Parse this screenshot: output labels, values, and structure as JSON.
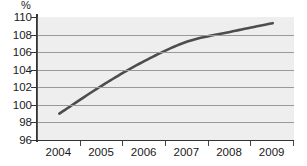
{
  "chart_data": {
    "type": "line",
    "title": "",
    "subtitle": "",
    "xlabel": "",
    "ylabel": "%",
    "unit_label": "%",
    "categories": [
      "2004",
      "2005",
      "2006",
      "2007",
      "2008",
      "2009"
    ],
    "x": [
      2004,
      2005,
      2006,
      2007,
      2008,
      2009
    ],
    "values": [
      99.0,
      102.2,
      105.0,
      107.2,
      108.3,
      109.3
    ],
    "series": [
      {
        "name": "",
        "values": [
          99.0,
          102.2,
          105.0,
          107.2,
          108.3,
          109.3
        ]
      }
    ],
    "ylim": [
      96,
      110
    ],
    "ytick_values": [
      110,
      108,
      106,
      104,
      102,
      100,
      98,
      96
    ],
    "ytick_labels": [
      "110",
      "108",
      "106",
      "104",
      "102",
      "100",
      "98",
      "96"
    ],
    "xtick_labels": [
      "2004",
      "2005",
      "2006",
      "2007",
      "2008",
      "2009"
    ],
    "grid": true,
    "grid_axis": "y",
    "legend": false,
    "legend_position": "none",
    "annotations": []
  },
  "style": {
    "line_color": "#4d4d4d",
    "plot_background": "#eeeeee",
    "grid_color": "#999999",
    "axis_color": "#333333",
    "text_color": "#1a1a1a",
    "page_background": "#ffffff"
  }
}
